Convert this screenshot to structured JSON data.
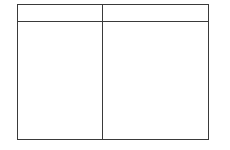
{
  "table": {
    "columns": [
      {
        "header": ""
      },
      {
        "header": ""
      }
    ],
    "rows": [
      [
        "",
        ""
      ]
    ]
  },
  "colors": {
    "line": "#3a3a3a",
    "background": "#ffffff"
  }
}
